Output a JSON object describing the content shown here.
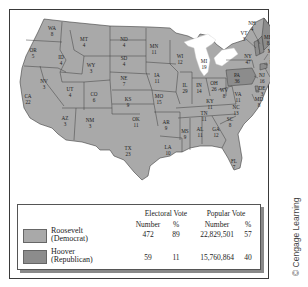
{
  "map": {
    "title": "1932 Presidential Election",
    "colors": {
      "roosevelt": "#a9a9a9",
      "hoover": "#8c8c8c",
      "border": "#3e3e3e",
      "water": "#ffffff"
    },
    "states": [
      {
        "abbr": "WA",
        "ev": "8",
        "winner": "roosevelt",
        "x": 52,
        "y": 30
      },
      {
        "abbr": "OR",
        "ev": "5",
        "winner": "roosevelt",
        "x": 33,
        "y": 52
      },
      {
        "abbr": "CA",
        "ev": "22",
        "winner": "roosevelt",
        "x": 28,
        "y": 98
      },
      {
        "abbr": "NV",
        "ev": "3",
        "winner": "roosevelt",
        "x": 44,
        "y": 83
      },
      {
        "abbr": "ID",
        "ev": "4",
        "winner": "roosevelt",
        "x": 61,
        "y": 59
      },
      {
        "abbr": "MT",
        "ev": "4",
        "winner": "roosevelt",
        "x": 84,
        "y": 41
      },
      {
        "abbr": "WY",
        "ev": "3",
        "winner": "roosevelt",
        "x": 91,
        "y": 67
      },
      {
        "abbr": "UT",
        "ev": "4",
        "winner": "roosevelt",
        "x": 70,
        "y": 91
      },
      {
        "abbr": "CO",
        "ev": "6",
        "winner": "roosevelt",
        "x": 94,
        "y": 96
      },
      {
        "abbr": "AZ",
        "ev": "3",
        "winner": "roosevelt",
        "x": 65,
        "y": 120
      },
      {
        "abbr": "NM",
        "ev": "3",
        "winner": "roosevelt",
        "x": 90,
        "y": 122
      },
      {
        "abbr": "ND",
        "ev": "4",
        "winner": "roosevelt",
        "x": 124,
        "y": 41
      },
      {
        "abbr": "SD",
        "ev": "4",
        "winner": "roosevelt",
        "x": 124,
        "y": 60
      },
      {
        "abbr": "NE",
        "ev": "7",
        "winner": "roosevelt",
        "x": 124,
        "y": 80
      },
      {
        "abbr": "KS",
        "ev": "9",
        "winner": "roosevelt",
        "x": 128,
        "y": 101
      },
      {
        "abbr": "OK",
        "ev": "11",
        "winner": "roosevelt",
        "x": 136,
        "y": 121
      },
      {
        "abbr": "TX",
        "ev": "23",
        "winner": "roosevelt",
        "x": 128,
        "y": 150
      },
      {
        "abbr": "MN",
        "ev": "11",
        "winner": "roosevelt",
        "x": 154,
        "y": 48
      },
      {
        "abbr": "IA",
        "ev": "11",
        "winner": "roosevelt",
        "x": 157,
        "y": 77
      },
      {
        "abbr": "MO",
        "ev": "15",
        "winner": "roosevelt",
        "x": 159,
        "y": 98
      },
      {
        "abbr": "AR",
        "ev": "9",
        "winner": "roosevelt",
        "x": 166,
        "y": 124
      },
      {
        "abbr": "LA",
        "ev": "10",
        "winner": "roosevelt",
        "x": 168,
        "y": 149
      },
      {
        "abbr": "WI",
        "ev": "12",
        "winner": "roosevelt",
        "x": 180,
        "y": 58
      },
      {
        "abbr": "IL",
        "ev": "29",
        "winner": "roosevelt",
        "x": 185,
        "y": 87
      },
      {
        "abbr": "MI",
        "ev": "19",
        "winner": "roosevelt",
        "x": 204,
        "y": 63
      },
      {
        "abbr": "IN",
        "ev": "14",
        "winner": "roosevelt",
        "x": 199,
        "y": 87
      },
      {
        "abbr": "OH",
        "ev": "26",
        "winner": "roosevelt",
        "x": 214,
        "y": 85
      },
      {
        "abbr": "KY",
        "ev": "11",
        "winner": "roosevelt",
        "x": 210,
        "y": 103
      },
      {
        "abbr": "TN",
        "ev": "11",
        "winner": "roosevelt",
        "x": 204,
        "y": 115
      },
      {
        "abbr": "MS",
        "ev": "9",
        "winner": "roosevelt",
        "x": 185,
        "y": 133
      },
      {
        "abbr": "AL",
        "ev": "11",
        "winner": "roosevelt",
        "x": 200,
        "y": 131
      },
      {
        "abbr": "GA",
        "ev": "12",
        "winner": "roosevelt",
        "x": 216,
        "y": 131
      },
      {
        "abbr": "FL",
        "ev": "7",
        "winner": "roosevelt",
        "x": 234,
        "y": 163
      },
      {
        "abbr": "SC",
        "ev": "8",
        "winner": "roosevelt",
        "x": 230,
        "y": 121
      },
      {
        "abbr": "NC",
        "ev": "13",
        "winner": "roosevelt",
        "x": 236,
        "y": 109
      },
      {
        "abbr": "VA",
        "ev": "11",
        "winner": "roosevelt",
        "x": 238,
        "y": 96
      },
      {
        "abbr": "WV",
        "ev": "8",
        "winner": "roosevelt",
        "x": 224,
        "y": 92
      },
      {
        "abbr": "PA",
        "ev": "36",
        "winner": "hoover",
        "x": 237,
        "y": 77
      },
      {
        "abbr": "NY",
        "ev": "47",
        "winner": "roosevelt",
        "x": 248,
        "y": 58
      },
      {
        "abbr": "MD",
        "ev": "8",
        "winner": "roosevelt",
        "x": 259,
        "y": 101
      },
      {
        "abbr": "DE",
        "ev": "3",
        "winner": "hoover",
        "x": 262,
        "y": 90
      },
      {
        "abbr": "NJ",
        "ev": "16",
        "winner": "roosevelt",
        "x": 262,
        "y": 77
      },
      {
        "abbr": "CT",
        "ev": "8",
        "winner": "hoover",
        "x": 274,
        "y": 77
      },
      {
        "abbr": "RI",
        "ev": "4",
        "winner": "roosevelt",
        "x": 272,
        "y": 64
      },
      {
        "abbr": "MA",
        "ev": "17",
        "winner": "roosevelt",
        "x": 272,
        "y": 53
      },
      {
        "abbr": "VT",
        "ev": "3",
        "winner": "hoover",
        "x": 244,
        "y": 35
      },
      {
        "abbr": "NH",
        "ev": "4",
        "winner": "hoover",
        "x": 252,
        "y": 25
      },
      {
        "abbr": "ME",
        "ev": "8",
        "winner": "hoover",
        "x": 268,
        "y": 39
      }
    ]
  },
  "legend": {
    "headers": {
      "electoral": "Electoral Vote",
      "popular": "Popular Vote",
      "number": "Number",
      "percent": "%"
    },
    "rows": [
      {
        "name": "Roosevelt",
        "party": "(Democrat)",
        "color": "#a9a9a9",
        "ev_number": "472",
        "ev_pct": "89",
        "pop_number": "22,829,501",
        "pop_pct": "57"
      },
      {
        "name": "Hoover",
        "party": "(Republican)",
        "color": "#8c8c8c",
        "ev_number": "59",
        "ev_pct": "11",
        "pop_number": "15,760,864",
        "pop_pct": "40"
      }
    ]
  },
  "credit": "© Cengage Learning"
}
